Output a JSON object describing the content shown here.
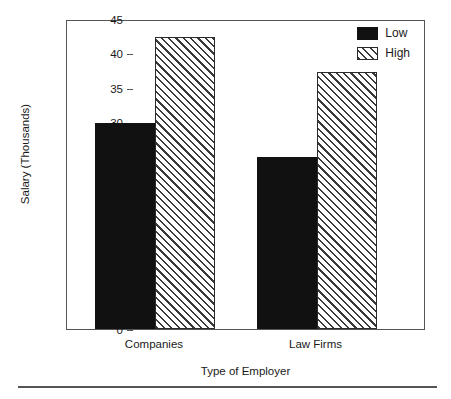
{
  "chart_data": {
    "type": "bar",
    "title": "",
    "subtitle": "",
    "xlabel": "Type of Employer",
    "ylabel": "Salary (Thousands)",
    "categories": [
      "Companies",
      "Law Firms"
    ],
    "series": [
      {
        "name": "Low",
        "values": [
          29.9,
          25.0
        ],
        "fill": "solid-black",
        "color": "#111111"
      },
      {
        "name": "High",
        "values": [
          42.4,
          37.3
        ],
        "fill": "diagonal-hatch",
        "color": "#ffffff"
      }
    ],
    "ylim": [
      0,
      45
    ],
    "ytick_values": [
      0,
      5,
      10,
      15,
      20,
      25,
      30,
      35,
      40,
      45
    ],
    "ytick_labels": [
      "0",
      "5",
      "10",
      "15",
      "20",
      "25",
      "30",
      "35",
      "40",
      "45"
    ],
    "grid": false,
    "legend_position": "top-right",
    "legend_entries": [
      "Low",
      "High"
    ],
    "annotations": []
  },
  "axis": {
    "y_title": "Salary (Thousands)",
    "x_title": "Type of Employer"
  },
  "legend": {
    "items": [
      {
        "label": "Low"
      },
      {
        "label": "High"
      }
    ]
  }
}
